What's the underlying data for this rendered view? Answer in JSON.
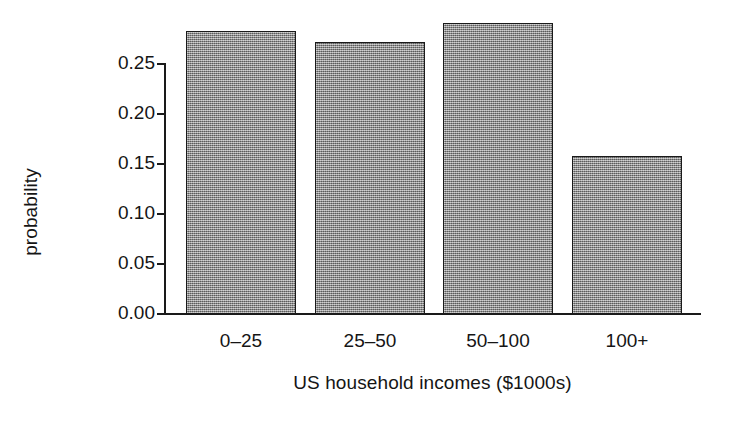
{
  "chart_data": {
    "type": "bar",
    "title": "",
    "xlabel": "US household incomes ($1000s)",
    "ylabel": "probability",
    "categories": [
      "0–25",
      "25–50",
      "50–100",
      "100+"
    ],
    "values": [
      0.283,
      0.272,
      0.291,
      0.158
    ],
    "ylim": [
      0.0,
      0.295
    ],
    "yticks": [
      0.0,
      0.05,
      0.1,
      0.15,
      0.2,
      0.25
    ],
    "ytick_labels": [
      "0.00",
      "0.05",
      "0.10",
      "0.15",
      "0.20",
      "0.25"
    ],
    "grid": false,
    "legend": "none",
    "bar_fill_color": "#8d8d8d",
    "bar_edge_color": "#1a1a1a",
    "axis_color": "#1a1a1a",
    "background_color": "#ffffff"
  }
}
